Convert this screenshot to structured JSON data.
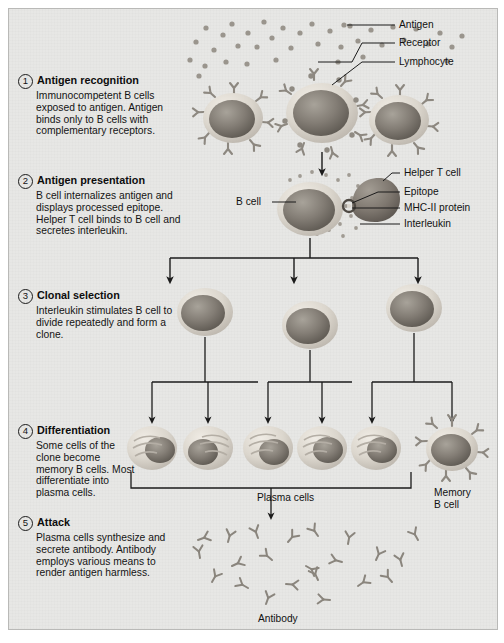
{
  "figure": {
    "background": "#e7e7e5",
    "ink": "#1b1b1b"
  },
  "steps": [
    {
      "number": "1",
      "title": "Antigen recognition",
      "body": "Immunocompetent B cells exposed to antigen. Antigen binds only to B cells with complementary receptors."
    },
    {
      "number": "2",
      "title": "Antigen presentation",
      "body": "B cell internalizes antigen and displays processed epitope. Helper T cell binds to B cell and secretes interleukin."
    },
    {
      "number": "3",
      "title": "Clonal selection",
      "body": "Interleukin stimulates B cell to divide repeatedly and form a clone."
    },
    {
      "number": "4",
      "title": "Differentiation",
      "body": "Some cells of the clone become memory B cells. Most differentiate into plasma cells."
    },
    {
      "number": "5",
      "title": "Attack",
      "body": "Plasma cells synthesize and secrete antibody. Antibody employs various means to render antigen harmless."
    }
  ],
  "callouts": {
    "antigen": "Antigen",
    "receptor": "Receptor",
    "lymphocyte": "Lymphocyte",
    "b_cell": "B cell",
    "helper_t_cell": "Helper T cell",
    "epitope": "Epitope",
    "mhc_ii_protein": "MHC-II protein",
    "interleukin": "Interleukin",
    "plasma_cells": "Plasma cells",
    "memory_b_cell_line1": "Memory",
    "memory_b_cell_line2": "B cell",
    "antibody": "Antibody"
  },
  "colors": {
    "cell_membrane": "#d8d4cd",
    "nucleus_dark": "#6f6a63",
    "nucleus_light": "#a9a49b",
    "receptor": "#8d8880",
    "antigen_dot": "#9a958d",
    "arrow": "#1b1b1b"
  }
}
